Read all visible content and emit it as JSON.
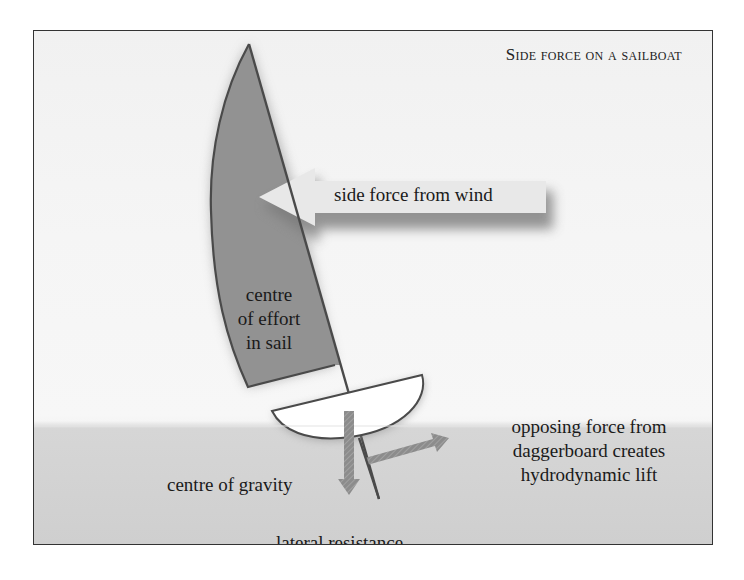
{
  "title": "Side force on a sailboat",
  "labels": {
    "side_force": "side force from wind",
    "centre_effort_1": "centre",
    "centre_effort_2": "of effort",
    "centre_effort_3": "in sail",
    "centre_gravity": "centre of gravity",
    "lateral_resistance": "lateral resistance",
    "opposing_1": "opposing force from",
    "opposing_2": "daggerboard creates",
    "opposing_3": "hydrodynamic lift"
  },
  "colors": {
    "sail": "#8f8f8f",
    "outline": "#4a4a4a",
    "arrow_fill": "#e6e6e6",
    "force_arrow": "#8a8a8a",
    "water": "#d2d2d2",
    "hull": "#ffffff"
  }
}
